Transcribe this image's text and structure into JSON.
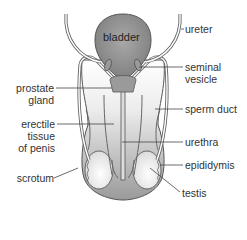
{
  "diagram": {
    "colors": {
      "organ_dark": "#8a8a8a",
      "organ_mid": "#b5b5b5",
      "organ_light": "#ececec",
      "outline": "#555555",
      "leader_line": "#444444",
      "label_text": "#333333"
    },
    "organ_labels": {
      "bladder": "bladder"
    },
    "labels_left": [
      {
        "id": "prostate",
        "lines": [
          "prostate",
          "gland"
        ]
      },
      {
        "id": "erectile",
        "lines": [
          "erectile",
          "tissue",
          "of penis"
        ]
      },
      {
        "id": "scrotum",
        "lines": [
          "scrotum"
        ]
      }
    ],
    "labels_right": [
      {
        "id": "ureter",
        "lines": [
          "ureter"
        ]
      },
      {
        "id": "seminal",
        "lines": [
          "seminal",
          "vesicle"
        ]
      },
      {
        "id": "sperm-duct",
        "lines": [
          "sperm duct"
        ]
      },
      {
        "id": "urethra",
        "lines": [
          "urethra"
        ]
      },
      {
        "id": "epididymis",
        "lines": [
          "epididymis"
        ]
      },
      {
        "id": "testis",
        "lines": [
          "testis"
        ]
      }
    ]
  }
}
